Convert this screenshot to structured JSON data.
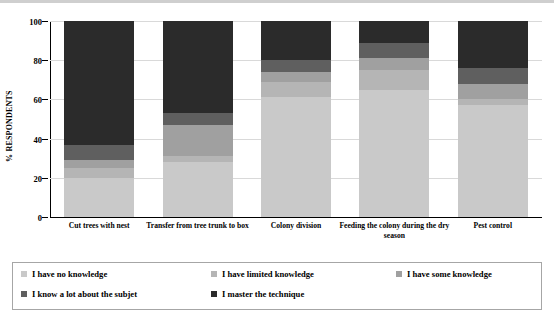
{
  "chart_data": {
    "type": "bar",
    "stacked": true,
    "title": "",
    "xlabel": "",
    "ylabel": "% RESPONDENTS",
    "ylim": [
      0,
      100
    ],
    "yticks": [
      0,
      20,
      40,
      60,
      80,
      100
    ],
    "grid": true,
    "legend_position": "bottom",
    "categories": [
      "Cut trees with nest",
      "Transfer from tree trunk to box",
      "Colony division",
      "Feeding the colony during the dry season",
      "Pest control"
    ],
    "series": [
      {
        "name": "I have no knowledge",
        "color": "#c9c9c9",
        "values": [
          20,
          28,
          61,
          65,
          57
        ]
      },
      {
        "name": "I have limited knowledge",
        "color": "#b5b5b5",
        "values": [
          5,
          3,
          8,
          10,
          3
        ]
      },
      {
        "name": "I have some knowledge",
        "color": "#a0a0a0",
        "values": [
          4,
          16,
          5,
          6,
          8
        ]
      },
      {
        "name": "I know a lot about the subjet",
        "color": "#5f5f5f",
        "values": [
          8,
          6,
          6,
          8,
          8
        ]
      },
      {
        "name": "I master the technique",
        "color": "#2b2b2b",
        "values": [
          63,
          47,
          20,
          11,
          24
        ]
      }
    ]
  },
  "axis": {
    "y_label": "% RESPONDENTS",
    "y_ticks": [
      "100",
      "80",
      "60",
      "40",
      "20",
      "0"
    ]
  },
  "legend": {
    "items": [
      {
        "label": "I have no knowledge",
        "color": "#c9c9c9"
      },
      {
        "label": "I have limited knowledge",
        "color": "#b5b5b5"
      },
      {
        "label": "I have some knowledge",
        "color": "#a0a0a0"
      },
      {
        "label": "I know a lot about the subjet",
        "color": "#5f5f5f"
      },
      {
        "label": "I master the technique",
        "color": "#2b2b2b"
      }
    ]
  }
}
